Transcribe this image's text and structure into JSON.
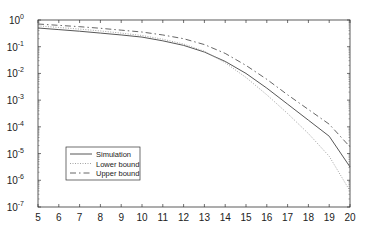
{
  "chart_data": {
    "type": "line",
    "title": "",
    "xlabel": "",
    "ylabel": "",
    "xlim": [
      5,
      20
    ],
    "ylim_log10": [
      -7,
      0
    ],
    "yscale": "log",
    "x_ticks": [
      "5",
      "6",
      "7",
      "8",
      "9",
      "10",
      "11",
      "12",
      "13",
      "14",
      "15",
      "16",
      "17",
      "18",
      "19",
      "20"
    ],
    "y_ticks": [
      {
        "base": "10",
        "exp": "0"
      },
      {
        "base": "10",
        "exp": "-1"
      },
      {
        "base": "10",
        "exp": "-2"
      },
      {
        "base": "10",
        "exp": "-3"
      },
      {
        "base": "10",
        "exp": "-4"
      },
      {
        "base": "10",
        "exp": "-5"
      },
      {
        "base": "10",
        "exp": "-6"
      },
      {
        "base": "10",
        "exp": "-7"
      }
    ],
    "legend_position": "lower-left",
    "series": [
      {
        "name": "Simulation",
        "style": "solid",
        "x": [
          5,
          6,
          7,
          8,
          9,
          10,
          11,
          12,
          13,
          14,
          15,
          16,
          17,
          18,
          19,
          20
        ],
        "log10_y": [
          -0.3,
          -0.36,
          -0.42,
          -0.49,
          -0.56,
          -0.64,
          -0.78,
          -0.95,
          -1.2,
          -1.55,
          -2.0,
          -2.55,
          -3.15,
          -3.75,
          -4.35,
          -5.5
        ]
      },
      {
        "name": "Lower bound",
        "style": "dotted",
        "x": [
          5,
          6,
          7,
          8,
          9,
          10,
          11,
          12,
          13,
          14,
          15,
          16,
          17,
          18,
          19,
          20
        ],
        "log10_y": [
          -0.22,
          -0.28,
          -0.34,
          -0.41,
          -0.49,
          -0.58,
          -0.72,
          -0.9,
          -1.17,
          -1.6,
          -2.15,
          -2.8,
          -3.5,
          -4.25,
          -5.1,
          -6.4
        ]
      },
      {
        "name": "Upper bound",
        "style": "dashdot",
        "x": [
          5,
          6,
          7,
          8,
          9,
          10,
          11,
          12,
          13,
          14,
          15,
          16,
          17,
          18,
          19,
          20
        ],
        "log10_y": [
          -0.15,
          -0.2,
          -0.25,
          -0.31,
          -0.38,
          -0.45,
          -0.56,
          -0.7,
          -0.92,
          -1.25,
          -1.7,
          -2.22,
          -2.8,
          -3.35,
          -3.9,
          -4.75
        ]
      }
    ]
  }
}
